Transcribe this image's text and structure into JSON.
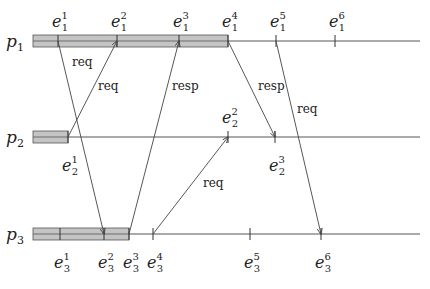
{
  "processes": [
    {
      "id": "p1",
      "label": "p",
      "index": "1",
      "y": 41,
      "bar": [
        33,
        228
      ],
      "events": [
        {
          "name": "e",
          "sub": "1",
          "sup": "1",
          "x": 58
        },
        {
          "name": "e",
          "sub": "1",
          "sup": "2",
          "x": 117
        },
        {
          "name": "e",
          "sub": "1",
          "sup": "3",
          "x": 179
        },
        {
          "name": "e",
          "sub": "1",
          "sup": "4",
          "x": 228
        },
        {
          "name": "e",
          "sub": "1",
          "sup": "5",
          "x": 276
        },
        {
          "name": "e",
          "sub": "1",
          "sup": "6",
          "x": 335
        }
      ]
    },
    {
      "id": "p2",
      "label": "p",
      "index": "2",
      "y": 137,
      "bar": [
        33,
        68
      ],
      "events": [
        {
          "name": "e",
          "sub": "2",
          "sup": "1",
          "x": 68,
          "below": true
        },
        {
          "name": "e",
          "sub": "2",
          "sup": "2",
          "x": 228
        },
        {
          "name": "e",
          "sub": "2",
          "sup": "3",
          "x": 275,
          "below": true
        }
      ]
    },
    {
      "id": "p3",
      "label": "p",
      "index": "3",
      "y": 234,
      "bar": [
        33,
        129
      ],
      "events": [
        {
          "name": "e",
          "sub": "3",
          "sup": "1",
          "x": 60,
          "below": true
        },
        {
          "name": "e",
          "sub": "3",
          "sup": "2",
          "x": 104,
          "below": true
        },
        {
          "name": "e",
          "sub": "3",
          "sup": "3",
          "x": 129,
          "below": true
        },
        {
          "name": "e",
          "sub": "3",
          "sup": "4",
          "x": 153,
          "below": true
        },
        {
          "name": "e",
          "sub": "3",
          "sup": "5",
          "x": 250,
          "below": true
        },
        {
          "name": "e",
          "sub": "3",
          "sup": "6",
          "x": 321,
          "below": true
        }
      ]
    }
  ],
  "messages": [
    {
      "label": "req",
      "from": [
        58,
        41
      ],
      "to": [
        104,
        234
      ],
      "lx": 72,
      "ly": 66
    },
    {
      "label": "req",
      "from": [
        68,
        137
      ],
      "to": [
        117,
        41
      ],
      "lx": 98,
      "ly": 90
    },
    {
      "label": "resp",
      "from": [
        129,
        234
      ],
      "to": [
        179,
        41
      ],
      "lx": 172,
      "ly": 90
    },
    {
      "label": "req",
      "from": [
        153,
        234
      ],
      "to": [
        228,
        137
      ],
      "lx": 203,
      "ly": 187
    },
    {
      "label": "resp",
      "from": [
        228,
        41
      ],
      "to": [
        275,
        137
      ],
      "lx": 258,
      "ly": 90
    },
    {
      "label": "req",
      "from": [
        276,
        41
      ],
      "to": [
        321,
        234
      ],
      "lx": 297,
      "ly": 113
    }
  ],
  "line_end_x": 420,
  "colors": {
    "bar_fill": "#c4c4c4",
    "bar_stroke": "#555555",
    "line": "#555555"
  }
}
